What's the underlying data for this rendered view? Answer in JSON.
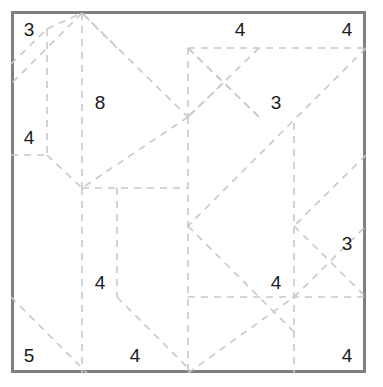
{
  "puzzle": {
    "type": "slitherlink-style dashed lattice grid",
    "board": {
      "left": 11,
      "top": 11,
      "width": 355,
      "height": 362,
      "border_color": "#808080",
      "border_width": 3,
      "background": "#ffffff"
    },
    "line_style": {
      "color": "#c8c8c8",
      "width": 1.6,
      "dash": "7 6"
    },
    "clues": [
      {
        "label": "3",
        "x": 29,
        "y": 29,
        "name": "clue-3-top-left"
      },
      {
        "label": "4",
        "x": 240,
        "y": 29,
        "name": "clue-4-top-mid"
      },
      {
        "label": "4",
        "x": 347,
        "y": 29,
        "name": "clue-4-top-right"
      },
      {
        "label": "8",
        "x": 100,
        "y": 102,
        "name": "clue-8-upper-left"
      },
      {
        "label": "3",
        "x": 276,
        "y": 102,
        "name": "clue-3-upper-right"
      },
      {
        "label": "4",
        "x": 29,
        "y": 137,
        "name": "clue-4-left"
      },
      {
        "label": "3",
        "x": 347,
        "y": 243,
        "name": "clue-3-right"
      },
      {
        "label": "4",
        "x": 100,
        "y": 282,
        "name": "clue-4-lower-left"
      },
      {
        "label": "4",
        "x": 276,
        "y": 282,
        "name": "clue-4-lower-right"
      },
      {
        "label": "5",
        "x": 29,
        "y": 355,
        "name": "clue-5-bottom-left"
      },
      {
        "label": "4",
        "x": 135,
        "y": 355,
        "name": "clue-4-bottom-mid"
      },
      {
        "label": "4",
        "x": 347,
        "y": 355,
        "name": "clue-4-bottom-right"
      }
    ],
    "segments": [
      {
        "x1": 11,
        "y1": 64,
        "x2": 47,
        "y2": 29,
        "name": "seg-tl-diag-a"
      },
      {
        "x1": 47,
        "y1": 29,
        "x2": 82,
        "y2": 13,
        "name": "seg-tl-diag-b"
      },
      {
        "x1": 47,
        "y1": 29,
        "x2": 47,
        "y2": 155,
        "name": "seg-v-x47-top"
      },
      {
        "x1": 82,
        "y1": 13,
        "x2": 82,
        "y2": 188,
        "name": "seg-v-x82-top"
      },
      {
        "x1": 82,
        "y1": 13,
        "x2": 188,
        "y2": 117,
        "name": "seg-diag-apex-right"
      },
      {
        "x1": 82,
        "y1": 13,
        "x2": 11,
        "y2": 84,
        "name": "seg-diag-apex-left"
      },
      {
        "x1": 11,
        "y1": 155,
        "x2": 47,
        "y2": 155,
        "name": "seg-h-left-155"
      },
      {
        "x1": 47,
        "y1": 155,
        "x2": 82,
        "y2": 188,
        "name": "seg-diag-x47-down"
      },
      {
        "x1": 82,
        "y1": 188,
        "x2": 188,
        "y2": 188,
        "name": "seg-h-mid-188"
      },
      {
        "x1": 188,
        "y1": 117,
        "x2": 188,
        "y2": 373,
        "name": "seg-v-center-x188"
      },
      {
        "x1": 188,
        "y1": 48,
        "x2": 188,
        "y2": 117,
        "name": "seg-v-center-upper"
      },
      {
        "x1": 188,
        "y1": 48,
        "x2": 366,
        "y2": 48,
        "name": "seg-h-top-right-48"
      },
      {
        "x1": 188,
        "y1": 48,
        "x2": 259,
        "y2": 117,
        "name": "seg-diag-tr-in"
      },
      {
        "x1": 259,
        "y1": 117,
        "x2": 188,
        "y2": 48,
        "name": "seg-diag-tr-dup"
      },
      {
        "x1": 223,
        "y1": 83,
        "x2": 188,
        "y2": 117,
        "name": "seg-diag-tr-small"
      },
      {
        "x1": 366,
        "y1": 48,
        "x2": 188,
        "y2": 226,
        "name": "seg-diag-long-tr-bl"
      },
      {
        "x1": 117,
        "y1": 188,
        "x2": 117,
        "y2": 297,
        "name": "seg-v-x117-lower"
      },
      {
        "x1": 82,
        "y1": 188,
        "x2": 82,
        "y2": 373,
        "name": "seg-v-x82-lower"
      },
      {
        "x1": 117,
        "y1": 297,
        "x2": 188,
        "y2": 368,
        "name": "seg-diag-bl-down"
      },
      {
        "x1": 11,
        "y1": 297,
        "x2": 87,
        "y2": 373,
        "name": "seg-diag-bottom-left"
      },
      {
        "x1": 294,
        "y1": 123,
        "x2": 294,
        "y2": 373,
        "name": "seg-v-x294"
      },
      {
        "x1": 188,
        "y1": 297,
        "x2": 366,
        "y2": 297,
        "name": "seg-h-right-297"
      },
      {
        "x1": 294,
        "y1": 297,
        "x2": 366,
        "y2": 226,
        "name": "seg-diag-br-up"
      },
      {
        "x1": 294,
        "y1": 226,
        "x2": 366,
        "y2": 297,
        "name": "seg-diag-br-down"
      },
      {
        "x1": 188,
        "y1": 226,
        "x2": 294,
        "y2": 332,
        "name": "seg-diag-br-long"
      },
      {
        "x1": 188,
        "y1": 373,
        "x2": 294,
        "y2": 297,
        "name": "seg-diag-bottom-mid"
      },
      {
        "x1": 117,
        "y1": 48,
        "x2": 82,
        "y2": 13,
        "name": "seg-diag-x117-up"
      },
      {
        "x1": 188,
        "y1": 117,
        "x2": 82,
        "y2": 188,
        "name": "seg-diag-center-bl"
      },
      {
        "x1": 259,
        "y1": 48,
        "x2": 188,
        "y2": 117,
        "name": "seg-diag-center-tr2"
      },
      {
        "x1": 366,
        "y1": 155,
        "x2": 294,
        "y2": 226,
        "name": "seg-diag-right-mid"
      }
    ]
  }
}
